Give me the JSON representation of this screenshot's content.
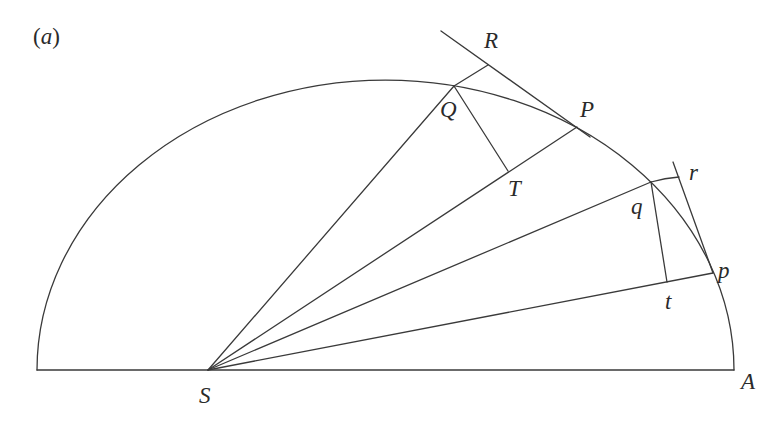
{
  "figure": {
    "panel_label_open": "(",
    "panel_label_letter": "a",
    "panel_label_close": ")",
    "stroke_color": "#3a3a3a",
    "text_color": "#2a2a2a",
    "background": "#ffffff"
  },
  "points": {
    "S": {
      "label": "S",
      "x": 208,
      "y": 370
    },
    "A": {
      "label": "A",
      "x": 734,
      "y": 370
    },
    "Q": {
      "label": "Q",
      "x": 454,
      "y": 86
    },
    "R": {
      "label": "R",
      "x": 488,
      "y": 65
    },
    "P": {
      "label": "P",
      "x": 577,
      "y": 127
    },
    "T": {
      "label": "T",
      "x": 508,
      "y": 171
    },
    "q": {
      "label": "q",
      "x": 651,
      "y": 182
    },
    "r": {
      "label": "r",
      "x": 679,
      "y": 177
    },
    "p": {
      "label": "p",
      "x": 713,
      "y": 273
    },
    "t": {
      "label": "t",
      "x": 667,
      "y": 282
    }
  },
  "labels": {
    "S": "S",
    "A": "A",
    "Q": "Q",
    "R": "R",
    "P": "P",
    "T": "T",
    "q": "q",
    "r": "r",
    "p": "p",
    "t": "t"
  }
}
